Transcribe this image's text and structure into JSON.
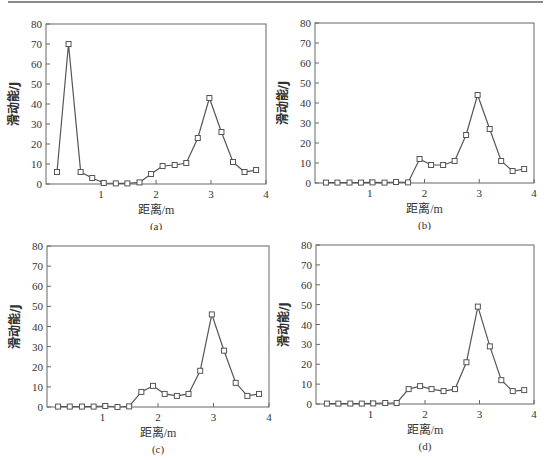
{
  "figure": {
    "panels": [
      "(a)",
      "(b)",
      "(c)",
      "(d)"
    ]
  },
  "chart_data": [
    {
      "type": "line",
      "panel_label": "(a)",
      "xlabel": "距离/m",
      "ylabel": "滑动能/J",
      "xlim": [
        0,
        4
      ],
      "ylim": [
        0,
        80
      ],
      "xticks": [
        1,
        2,
        3,
        4
      ],
      "yticks": [
        0,
        10,
        20,
        30,
        40,
        50,
        60,
        70,
        80
      ],
      "grid": false,
      "marker": "open-square",
      "x": [
        0.2,
        0.41,
        0.63,
        0.84,
        1.05,
        1.27,
        1.48,
        1.7,
        1.91,
        2.12,
        2.34,
        2.55,
        2.76,
        2.97,
        3.19,
        3.4,
        3.61,
        3.82
      ],
      "values": [
        6,
        70,
        6,
        3,
        0.5,
        0.3,
        0.3,
        0.8,
        5,
        9,
        9.5,
        10.5,
        23,
        43,
        26,
        11,
        6,
        7
      ]
    },
    {
      "type": "line",
      "panel_label": "(b)",
      "xlabel": "距离/m",
      "ylabel": "滑动能/J",
      "xlim": [
        0,
        4
      ],
      "ylim": [
        0,
        80
      ],
      "xticks": [
        1,
        2,
        3,
        4
      ],
      "yticks": [
        0,
        10,
        20,
        30,
        40,
        50,
        60,
        70,
        80
      ],
      "grid": false,
      "marker": "open-square",
      "x": [
        0.2,
        0.41,
        0.63,
        0.84,
        1.05,
        1.27,
        1.48,
        1.7,
        1.91,
        2.12,
        2.34,
        2.55,
        2.76,
        2.97,
        3.19,
        3.4,
        3.61,
        3.82
      ],
      "values": [
        0.2,
        0.2,
        0.2,
        0.2,
        0.3,
        0.2,
        0.5,
        0.3,
        12,
        9,
        9,
        11,
        24,
        44,
        27,
        11,
        6,
        7
      ]
    },
    {
      "type": "line",
      "panel_label": "(c)",
      "xlabel": "距离/m",
      "ylabel": "滑动能/J",
      "xlim": [
        0,
        4
      ],
      "ylim": [
        0,
        80
      ],
      "xticks": [
        1,
        2,
        3,
        4
      ],
      "yticks": [
        0,
        10,
        20,
        30,
        40,
        50,
        60,
        70,
        80
      ],
      "grid": false,
      "marker": "open-square",
      "x": [
        0.2,
        0.41,
        0.63,
        0.84,
        1.05,
        1.27,
        1.48,
        1.7,
        1.91,
        2.12,
        2.34,
        2.55,
        2.76,
        2.97,
        3.19,
        3.4,
        3.61,
        3.82
      ],
      "values": [
        0.2,
        0.2,
        0.2,
        0.2,
        0.5,
        0,
        0.3,
        7.5,
        10.5,
        6.5,
        5.5,
        6.5,
        18,
        46,
        28,
        12,
        5.5,
        6.5
      ]
    },
    {
      "type": "line",
      "panel_label": "(d)",
      "xlabel": "距离/m",
      "ylabel": "滑动能/J",
      "xlim": [
        0,
        4
      ],
      "ylim": [
        0,
        80
      ],
      "xticks": [
        1,
        2,
        3,
        4
      ],
      "yticks": [
        0,
        10,
        20,
        30,
        40,
        50,
        60,
        70,
        80
      ],
      "grid": false,
      "marker": "open-square",
      "x": [
        0.2,
        0.41,
        0.63,
        0.84,
        1.05,
        1.27,
        1.48,
        1.7,
        1.91,
        2.12,
        2.34,
        2.55,
        2.76,
        2.97,
        3.19,
        3.4,
        3.61,
        3.82
      ],
      "values": [
        0.2,
        0.2,
        0.2,
        0.2,
        0.3,
        0.5,
        0.5,
        7.5,
        9,
        7.5,
        6.5,
        7.5,
        21,
        49,
        29,
        12,
        6.5,
        7
      ]
    }
  ]
}
